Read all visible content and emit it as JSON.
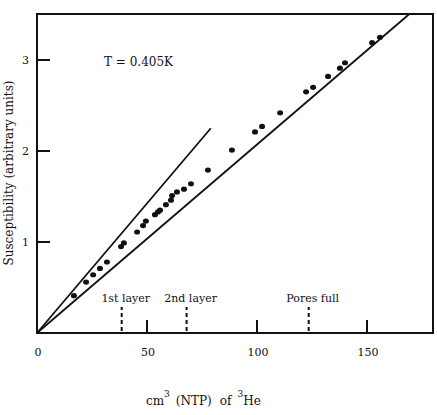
{
  "chart_data": {
    "type": "scatter",
    "title": "",
    "annotation": "T = 0.405K",
    "xlabel": "cm^3 (NTP) of ^3He",
    "xlabel_parts": {
      "a": "cm",
      "a_sup": "3",
      "b": "(NTP)",
      "c": "of",
      "c_sup": "3",
      "d": "He"
    },
    "ylabel": "Susceptibility (arbitrary units)",
    "xlim": [
      0,
      180
    ],
    "ylim": [
      0,
      3.5
    ],
    "x_ticks": [
      0,
      50,
      100,
      150
    ],
    "x_tick_labels": [
      "0",
      "50",
      "100",
      "150"
    ],
    "y_ticks": [
      1,
      2,
      3
    ],
    "y_tick_labels": [
      "1",
      "2",
      "3"
    ],
    "grid": false,
    "legend": null,
    "markers": [
      {
        "label": "1st layer",
        "x": 38.5
      },
      {
        "label": "2nd layer",
        "x": 68
      },
      {
        "label": "Pores full",
        "x": 123.5
      }
    ],
    "lines": [
      {
        "name": "fit",
        "x": [
          0,
          169
        ],
        "y": [
          0,
          3.5
        ]
      },
      {
        "name": "initial-slope tangent",
        "x": [
          0,
          79
        ],
        "y": [
          0,
          2.25
        ]
      }
    ],
    "series": [
      {
        "name": "data",
        "x": [
          16.8,
          22.3,
          25.5,
          28.6,
          31.8,
          38.2,
          39.5,
          45.5,
          48.2,
          49.5,
          53.6,
          55.0,
          55.9,
          58.6,
          60.9,
          61.4,
          63.6,
          66.8,
          70.0,
          77.7,
          88.6,
          99.1,
          102.3,
          110.5,
          122.3,
          125.5,
          132.3,
          137.7,
          140.0,
          152.3,
          155.9
        ],
        "y": [
          0.41,
          0.56,
          0.64,
          0.71,
          0.78,
          0.95,
          0.99,
          1.11,
          1.18,
          1.23,
          1.3,
          1.33,
          1.35,
          1.41,
          1.46,
          1.51,
          1.55,
          1.58,
          1.64,
          1.79,
          2.01,
          2.21,
          2.27,
          2.42,
          2.65,
          2.7,
          2.82,
          2.91,
          2.97,
          3.19,
          3.25
        ]
      }
    ]
  }
}
